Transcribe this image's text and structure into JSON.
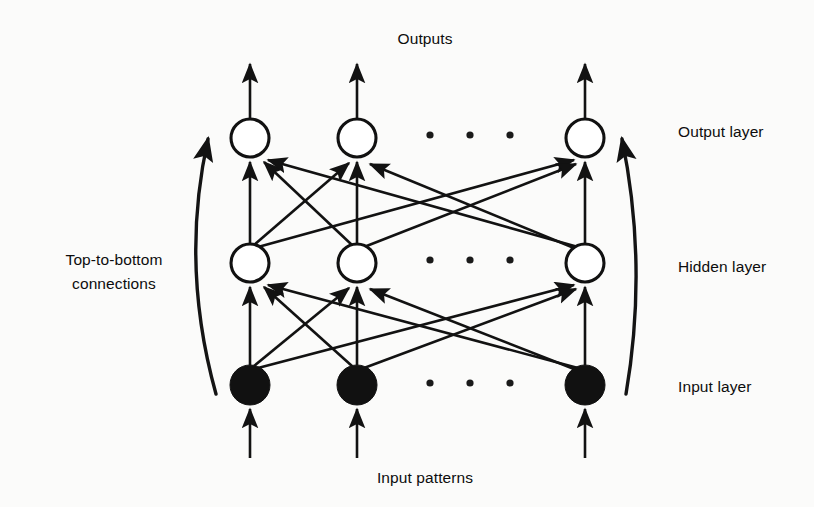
{
  "figure": {
    "type": "neural-network-architecture-diagram",
    "background_color": "#fbfbfa",
    "ink_color": "#121212",
    "title_top": "Outputs",
    "caption_bottom": "Input patterns"
  },
  "labels": {
    "outputs": "Outputs",
    "input_patterns": "Input patterns",
    "output_layer": "Output layer",
    "hidden_layer": "Hidden layer",
    "input_layer": "Input layer",
    "top_to_bottom_line1": "Top-to-bottom",
    "top_to_bottom_line2": "connections"
  },
  "layers": [
    {
      "name": "output-layer",
      "label": "Output layer",
      "node_style": "open-circle",
      "y": 138,
      "radius": 19,
      "node_x": [
        250,
        357,
        585
      ],
      "ellipsis_dots_x": [
        430,
        470,
        510
      ],
      "has_outgoing_arrows_up": true
    },
    {
      "name": "hidden-layer",
      "label": "Hidden layer",
      "node_style": "open-circle",
      "y": 263,
      "radius": 19,
      "node_x": [
        250,
        357,
        585
      ],
      "ellipsis_dots_x": [
        430,
        470,
        510
      ],
      "has_outgoing_arrows_up": false
    },
    {
      "name": "input-layer",
      "label": "Input layer",
      "node_style": "filled-circle",
      "y": 385,
      "radius": 20,
      "node_x": [
        250,
        357,
        585
      ],
      "ellipsis_dots_x": [
        430,
        470,
        510
      ],
      "has_incoming_arrows_up": true
    }
  ],
  "connections": {
    "description": "fully-connected upward arrows from each lower-layer node to every upper-layer node",
    "direction": "bottom-to-top",
    "arrowheads": true,
    "pairs_hidden_to_output": [
      [
        0,
        0
      ],
      [
        0,
        1
      ],
      [
        0,
        2
      ],
      [
        1,
        0
      ],
      [
        1,
        1
      ],
      [
        1,
        2
      ],
      [
        2,
        0
      ],
      [
        2,
        1
      ],
      [
        2,
        2
      ]
    ],
    "pairs_input_to_hidden": [
      [
        0,
        0
      ],
      [
        0,
        1
      ],
      [
        0,
        2
      ],
      [
        1,
        0
      ],
      [
        1,
        1
      ],
      [
        1,
        2
      ],
      [
        2,
        0
      ],
      [
        2,
        1
      ],
      [
        2,
        2
      ]
    ]
  },
  "side_arrows": [
    {
      "name": "left-top-to-bottom-arrow",
      "side": "left",
      "direction": "upward",
      "label": "Top-to-bottom connections",
      "start": [
        216,
        393
      ],
      "control": [
        181,
        262
      ],
      "end": [
        210,
        133
      ]
    },
    {
      "name": "right-bottom-to-top-arrow",
      "side": "right",
      "direction": "upward",
      "start": [
        626,
        393
      ],
      "control": [
        647,
        262
      ],
      "end": [
        620,
        133
      ]
    }
  ],
  "text_positions": {
    "outputs": [
      425,
      44
    ],
    "input_patterns": [
      425,
      483
    ],
    "output_layer": [
      678,
      137
    ],
    "hidden_layer": [
      678,
      272
    ],
    "input_layer": [
      678,
      392
    ],
    "top_to_bottom_line1": [
      114,
      264
    ],
    "top_to_bottom_line2": [
      114,
      288
    ]
  }
}
